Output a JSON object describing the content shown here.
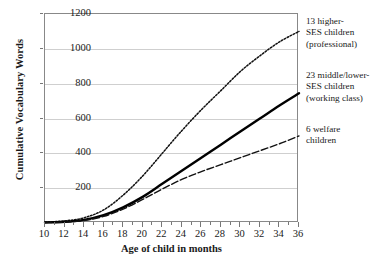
{
  "chart_data": {
    "type": "line",
    "title": "",
    "xlabel": "Age of child in months",
    "ylabel": "Cumulative Vocabulary Words",
    "xlim": [
      10,
      36
    ],
    "ylim": [
      0,
      1200
    ],
    "yticks": [
      0,
      200,
      400,
      600,
      800,
      1000,
      1200
    ],
    "ytick_labels": [
      "",
      "200",
      "400",
      "600",
      "800",
      "1000",
      "1200"
    ],
    "xticks": [
      10,
      12,
      14,
      16,
      18,
      20,
      22,
      24,
      26,
      28,
      30,
      32,
      34,
      36
    ],
    "xtick_labels": [
      "10",
      "12",
      "14",
      "16",
      "18",
      "20",
      "22",
      "24",
      "26",
      "28",
      "30",
      "32",
      "34",
      "36"
    ],
    "x_minor_ticks": [
      11,
      13,
      15,
      17,
      19,
      21,
      23,
      25,
      27,
      29,
      31,
      33,
      35
    ],
    "grid": "horizontal",
    "legend_position": "right-outside",
    "x": [
      10,
      12,
      14,
      16,
      18,
      20,
      22,
      24,
      26,
      28,
      30,
      32,
      34,
      36
    ],
    "series": [
      {
        "name": "13 higher-SES children (professional)",
        "label_lines": [
          "13 higher-",
          "SES children",
          "(professional)"
        ],
        "style": "dotted",
        "color": "#111111",
        "values": [
          5,
          12,
          30,
          75,
          160,
          270,
          400,
          530,
          650,
          760,
          870,
          960,
          1040,
          1100
        ]
      },
      {
        "name": "23 middle/lower-SES children (working class)",
        "label_lines": [
          "23 middle/lower-",
          "SES children",
          "(working class)"
        ],
        "style": "solid",
        "color": "#000000",
        "values": [
          3,
          7,
          18,
          45,
          90,
          150,
          225,
          300,
          375,
          450,
          525,
          600,
          675,
          745
        ]
      },
      {
        "name": "6 welfare children",
        "label_lines": [
          "6 welfare",
          "children"
        ],
        "style": "dash-dot",
        "color": "#111111",
        "values": [
          2,
          5,
          14,
          38,
          80,
          135,
          195,
          250,
          295,
          335,
          375,
          415,
          455,
          500
        ]
      }
    ]
  }
}
